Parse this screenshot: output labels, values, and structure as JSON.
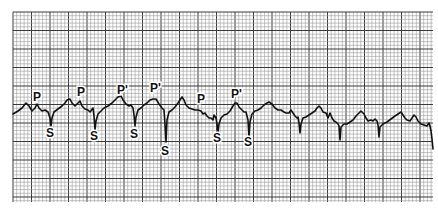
{
  "figure": {
    "type": "ecg-rhythm-strip",
    "grid": {
      "x0": 13,
      "y0": 12,
      "x1": 433,
      "y1": 202,
      "minor_spacing": 3.7,
      "major_every": 5,
      "minor_color": "#9a9a9a",
      "major_color": "#3a3a3a"
    },
    "trace_color": "#111111",
    "labels": [
      {
        "text": "P",
        "x": 33,
        "y": 101,
        "kind": "p-wave"
      },
      {
        "text": "P",
        "x": 77,
        "y": 96,
        "kind": "p-wave"
      },
      {
        "text": "P'",
        "x": 117,
        "y": 94,
        "kind": "ectopic-p-wave"
      },
      {
        "text": "P'",
        "x": 150,
        "y": 92,
        "kind": "ectopic-p-wave"
      },
      {
        "text": "P",
        "x": 197,
        "y": 103,
        "kind": "p-wave"
      },
      {
        "text": "P'",
        "x": 231,
        "y": 98,
        "kind": "ectopic-p-wave"
      },
      {
        "text": "S",
        "x": 46,
        "y": 137,
        "kind": "s-wave"
      },
      {
        "text": "S",
        "x": 90,
        "y": 140,
        "kind": "s-wave"
      },
      {
        "text": "S",
        "x": 130,
        "y": 138,
        "kind": "s-wave"
      },
      {
        "text": "S",
        "x": 161,
        "y": 155,
        "kind": "s-wave"
      },
      {
        "text": "S",
        "x": 213,
        "y": 142,
        "kind": "s-wave"
      },
      {
        "text": "S",
        "x": 244,
        "y": 146,
        "kind": "s-wave"
      }
    ],
    "trace_points": "13,114 18,111 22,108 26,103 29,106 32,111 35,108 37,104 39,108 42,111 45,110 48,112 50,118 51,126 52,118 54,112 58,109 62,106 65,103 67,100 70,99 72,103 75,106 78,103 80,101 82,106 85,109 88,110 90,112 93,108 94,116 95,130 96,121 98,114 101,111 104,108 108,106 112,103 115,100 118,97 121,96 123,100 126,104 129,106 131,105 133,108 134,115 135,126 136,117 138,110 141,108 144,105 147,103 150,100 153,99 156,99 159,104 162,108 164,110 165,125 166,142 167,120 169,112 172,110 175,107 178,103 180,100 182,97 184,100 186,105 189,108 192,109 195,110 198,110 201,111 203,114 205,113 207,116 209,118 211,118 213,120 214,115 216,118 217,124 218,132 219,124 221,118 224,115 227,114 230,111 233,106 235,103 237,103 239,107 242,110 244,112 246,112 248,120 249,137 250,122 252,114 255,111 258,110 261,108 264,105 267,103 269,102 272,104 275,108 278,110 281,110 284,112 286,113 289,113 291,110 293,113 295,116 297,118 298,117 299,123 300,133 301,124 303,118 306,117 309,115 312,113 315,111 317,108 319,106 321,108 323,112 326,113 328,118 330,113 332,118 334,121 336,122 338,124 339,126 340,140 341,127 344,124 347,124 350,122 353,120 356,116 359,113 361,111 364,114 366,118 368,121 371,120 373,121 375,119 377,121 378,125 379,137 380,127 383,124 387,122 391,119 395,116 398,114 401,112 403,115 405,118 407,120 410,121 412,118 414,115 416,117 418,121 421,124 424,125 427,126 429,123 430,126 431,131 432,139 433,149"
  }
}
